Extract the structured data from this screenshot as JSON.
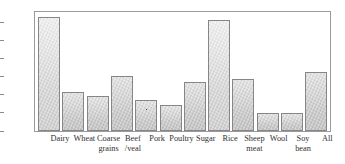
{
  "chart_data": {
    "type": "bar",
    "title": "",
    "xlabel": "",
    "ylabel": "%",
    "ylim": [
      0,
      66
    ],
    "grid": false,
    "legend": null,
    "y_unit_label": "%",
    "y_ticks": [
      10,
      20,
      30,
      40,
      50,
      60
    ],
    "y_tick_labels": [
      "10",
      "20",
      "30",
      "40",
      "50",
      "60"
    ],
    "categories": [
      "Dairy",
      "Wheat",
      "Coarse\ngrains",
      "Beef\n/veal",
      "Pork",
      "Poultry",
      "Sugar",
      "Rice",
      "Sheep\nmeat",
      "Wool",
      "Soy\nbean",
      "All"
    ],
    "values": [
      63.5,
      21.5,
      19.5,
      30.5,
      17,
      14.5,
      27,
      61.5,
      29,
      10,
      9.8,
      33
    ]
  },
  "style": {
    "bar_fill": "#d6d6d6",
    "bar_border": "#86868a",
    "axis_color": "#9a9a9a",
    "text_color": "#2f2f2f",
    "background": "#ffffff"
  }
}
